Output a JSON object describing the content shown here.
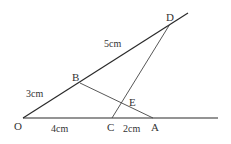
{
  "diagram": {
    "type": "geometry",
    "stroke_color": "#333333",
    "points": {
      "O": {
        "label": "O",
        "x": 23,
        "y": 118
      },
      "B": {
        "label": "B",
        "x": 80,
        "y": 83
      },
      "D": {
        "label": "D",
        "x": 170,
        "y": 24
      },
      "C": {
        "label": "C",
        "x": 112,
        "y": 118
      },
      "A": {
        "label": "A",
        "x": 153,
        "y": 118
      },
      "E": {
        "label": "E",
        "x": 123,
        "y": 104
      }
    },
    "lengths": {
      "OB": "3cm",
      "BD": "5cm",
      "OC": "4cm",
      "CA": "2cm"
    },
    "segments": [
      {
        "name": "ray-OD",
        "from": "O",
        "to": "D",
        "extended": true
      },
      {
        "name": "ray-OA",
        "from": "O",
        "to": "A",
        "extended": true
      },
      {
        "name": "segment-BA",
        "from": "B",
        "to": "A"
      },
      {
        "name": "segment-CD",
        "from": "C",
        "to": "D"
      }
    ]
  }
}
